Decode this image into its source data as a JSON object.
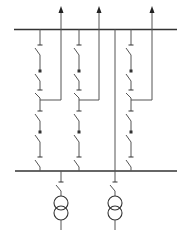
{
  "diagram": {
    "title": "",
    "type": "single-line-diagram",
    "colors": {
      "line": "#555555",
      "bus": "#333333",
      "background": "#ffffff"
    },
    "top_bus": {
      "x1": 14,
      "x2": 177,
      "y": 29.5
    },
    "bottom_bus": {
      "x1": 15,
      "x2": 177,
      "y": 171
    },
    "tie_line": {
      "x": 115,
      "y1": 29.5,
      "y2": 171
    },
    "feeders": [
      {
        "id": "feeder-1",
        "x": 40,
        "out_x": 61,
        "tap_y": 100,
        "arrow_top": 6
      },
      {
        "id": "feeder-2",
        "x": 79,
        "out_x": 99,
        "tap_y": 100,
        "arrow_top": 6
      },
      {
        "id": "feeder-3",
        "x": 131,
        "out_x": 152,
        "tap_y": 100,
        "arrow_top": 6
      }
    ],
    "switch_positions_y": [
      {
        "top": 41,
        "bottom": 58,
        "kind": "disconnector"
      },
      {
        "top": 67,
        "bottom": 84,
        "kind": "breaker"
      },
      {
        "top": 87,
        "bottom": 100,
        "kind": "disconnector"
      },
      {
        "top": 107,
        "bottom": 124,
        "kind": "disconnector"
      },
      {
        "top": 128,
        "bottom": 145,
        "kind": "breaker"
      },
      {
        "top": 153,
        "bottom": 170,
        "kind": "disconnector"
      }
    ],
    "transformers": [
      {
        "id": "transformer-1",
        "x": 61,
        "switch_top": 178,
        "switch_bottom": 193,
        "c1": 203,
        "c2": 213,
        "r": 7,
        "tail": 230
      },
      {
        "id": "transformer-2",
        "x": 115,
        "switch_top": 178,
        "switch_bottom": 193,
        "c1": 203,
        "c2": 213,
        "r": 7,
        "tail": 230
      }
    ]
  }
}
